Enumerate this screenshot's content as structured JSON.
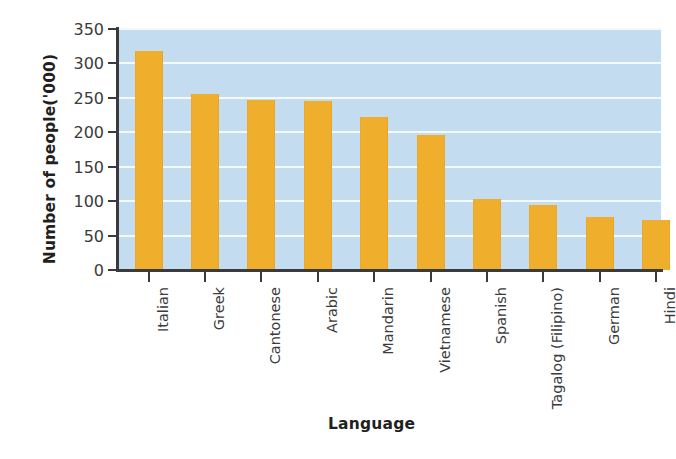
{
  "chart_data": {
    "type": "bar",
    "title": "",
    "xlabel": "Language",
    "ylabel": "Number of people('000)",
    "categories": [
      "Italian",
      "Greek",
      "Cantonese",
      "Arabic",
      "Mandarin",
      "Vietnamese",
      "Spanish",
      "Tagalog (Filipino)",
      "German",
      "Hindi"
    ],
    "values": [
      318,
      255,
      247,
      245,
      222,
      196,
      103,
      95,
      77,
      72
    ],
    "ylim": [
      0,
      350
    ],
    "yticks": [
      0,
      50,
      100,
      150,
      200,
      250,
      300,
      350
    ],
    "ytick_labels": [
      "0",
      "50",
      "100",
      "150",
      "200",
      "250",
      "300",
      "350"
    ],
    "grid": true,
    "legend": "none",
    "colors": {
      "bar": "#efaf2d",
      "plot_background": "#c3dcef",
      "gridline": "#f3f9fc",
      "axis": "#3b3b3d",
      "text": "#231f20",
      "page_background": "#ffffff"
    }
  }
}
